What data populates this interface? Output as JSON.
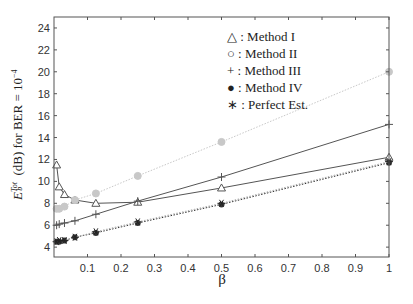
{
  "chart_data": {
    "type": "line",
    "title": "",
    "xlabel": "β",
    "ylabel": "E_b^Tot / N_0 (dB) for BER = 10^-4",
    "xlim": [
      0,
      1
    ],
    "ylim": [
      3.1,
      25
    ],
    "xticks": [
      "0.1",
      "0.2",
      "0.3",
      "0.4",
      "0.5",
      "0.6",
      "0.7",
      "0.8",
      "0.9",
      "1"
    ],
    "yticks": [
      "4",
      "6",
      "8",
      "10",
      "12",
      "14",
      "16",
      "18",
      "20",
      "22",
      "24"
    ],
    "grid": false,
    "legend_position": "upper-middle-right",
    "x": [
      0.0078,
      0.0156,
      0.03125,
      0.0625,
      0.125,
      0.25,
      0.5,
      1.0
    ],
    "series": [
      {
        "name": "Method I",
        "marker": "triangle",
        "color": "#555555",
        "style": "solid",
        "values": [
          11.5,
          9.5,
          8.8,
          8.3,
          8.0,
          8.1,
          9.4,
          12.2
        ]
      },
      {
        "name": "Method II",
        "marker": "circle",
        "color": "#c8c8c8",
        "style": "dotted",
        "values": [
          7.5,
          7.5,
          7.7,
          8.3,
          8.9,
          10.5,
          13.6,
          20.0
        ]
      },
      {
        "name": "Method III",
        "marker": "plus",
        "color": "#555555",
        "style": "solid",
        "values": [
          6.0,
          6.1,
          6.2,
          6.4,
          7.0,
          8.2,
          10.4,
          15.2
        ]
      },
      {
        "name": "Method IV",
        "marker": "dot",
        "color": "#333333",
        "style": "dotted",
        "values": [
          4.5,
          4.5,
          4.6,
          4.9,
          5.3,
          6.2,
          7.9,
          11.7
        ]
      },
      {
        "name": "Perfect Est.",
        "marker": "star",
        "color": "#aaaaaa",
        "style": "dotted",
        "values": [
          4.5,
          4.6,
          4.6,
          4.9,
          5.4,
          6.3,
          8.0,
          11.8
        ]
      }
    ]
  },
  "legend": {
    "items": [
      {
        "symbol": "△",
        "label": ": Method I"
      },
      {
        "symbol": "○",
        "label": ": Method II"
      },
      {
        "symbol": "+",
        "label": ": Method III"
      },
      {
        "symbol": "●",
        "label": ": Method IV"
      },
      {
        "symbol": "∗",
        "label": ": Perfect Est."
      }
    ]
  },
  "axes": {
    "xlabel": "β",
    "ylabel_main": "(dB) for BER = 10",
    "ylabel_exp": "−4",
    "ylabel_frac_num": "E",
    "ylabel_frac_num_sup": "Tot",
    "ylabel_frac_num_sub": "b",
    "ylabel_frac_den": "N",
    "ylabel_frac_den_sub": "0"
  }
}
